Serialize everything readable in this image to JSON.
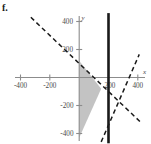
{
  "figure": {
    "part_label": "f.",
    "background": "#ffffff",
    "axis_color": "#8c8c8c",
    "line_color": "#1a1a1a",
    "shade_color": "#b9b9b9"
  },
  "axes": {
    "x_label": "x",
    "y_label": "y",
    "x_ticks": [
      {
        "value": -400,
        "label": "-400"
      },
      {
        "value": -200,
        "label": "-200"
      },
      {
        "value": 200,
        "label": "200"
      },
      {
        "value": 400,
        "label": "400"
      }
    ],
    "y_ticks": [
      {
        "value": 400,
        "label": "400"
      },
      {
        "value": 200,
        "label": "200"
      },
      {
        "value": -200,
        "label": "-200"
      },
      {
        "value": -400,
        "label": "-400"
      }
    ]
  },
  "chart_data": {
    "type": "line",
    "title": "",
    "subtitle": "",
    "xlabel": "x",
    "ylabel": "y",
    "xlim": [
      -480,
      470
    ],
    "ylim": [
      -470,
      460
    ],
    "grid": false,
    "legend": null,
    "xticks": [
      -400,
      -200,
      200,
      400
    ],
    "yticks": [
      -400,
      -200,
      200,
      400
    ],
    "xticklabels": [
      "-400",
      "-200",
      "200",
      "400"
    ],
    "yticklabels": [
      "-400",
      "-200",
      "200",
      "400"
    ],
    "series": [
      {
        "name": "vertical-boundary",
        "style": "solid-thick",
        "color": "#1a1a1a",
        "equation": "x = 200",
        "points": [
          [
            200,
            460
          ],
          [
            200,
            -470
          ]
        ]
      },
      {
        "name": "descending-dashed-boundary",
        "style": "dashed",
        "color": "#1a1a1a",
        "equation": "y = -x + 100",
        "points": [
          [
            -330,
            430
          ],
          [
            430,
            -330
          ]
        ]
      },
      {
        "name": "ascending-dashed-boundary",
        "style": "dashed",
        "color": "#1a1a1a",
        "equation": "y = 2.4x - 520",
        "points": [
          [
            150,
            -460
          ],
          [
            410,
            165
          ]
        ]
      }
    ],
    "shaded_region": {
      "name": "feasible-region",
      "fill": "#b9b9b9",
      "opacity": 0.85,
      "vertices": [
        [
          0,
          120
        ],
        [
          150,
          -80
        ],
        [
          0,
          -430
        ]
      ]
    },
    "annotations": [
      {
        "text": "f.",
        "x_px": 2,
        "y_px": 3
      }
    ]
  }
}
